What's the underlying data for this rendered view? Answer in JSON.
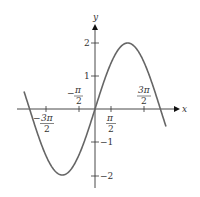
{
  "chart_data": {
    "type": "line",
    "title": "",
    "function": "y = 2 sin(x)",
    "xlabel": "x",
    "ylabel": "y",
    "xlim": [
      -2.2,
      2.2
    ],
    "xlim_note": "in units of pi: approx -2.2 to 2.2",
    "ylim": [
      -2.5,
      2.5
    ],
    "grid": false,
    "legend": null,
    "x_ticks": [
      {
        "value": -4.712,
        "label_num": "3π",
        "label_den": "2",
        "sign": "−"
      },
      {
        "value": -1.571,
        "label_num": "π",
        "label_den": "2",
        "sign": "−"
      },
      {
        "value": 1.571,
        "label_num": "π",
        "label_den": "2",
        "sign": ""
      },
      {
        "value": 4.712,
        "label_num": "3π",
        "label_den": "2",
        "sign": ""
      }
    ],
    "y_ticks": [
      {
        "value": 2,
        "label": "2"
      },
      {
        "value": 1,
        "label": "1"
      },
      {
        "value": -1,
        "label": "−1"
      },
      {
        "value": -2,
        "label": "−2"
      }
    ],
    "series": [
      {
        "name": "2 sin x",
        "color": "#666666",
        "x": [
          -6.8,
          -6.28,
          -4.71,
          -3.14,
          -1.57,
          0,
          1.57,
          3.14,
          4.71,
          6.28,
          6.8
        ],
        "y": [
          -0.99,
          0,
          2,
          0,
          -2,
          0,
          2,
          0,
          -2,
          0,
          0.99
        ]
      }
    ]
  },
  "axes": {
    "x_label": "x",
    "y_label": "y"
  },
  "colors": {
    "curve": "#666666",
    "axis": "#333333"
  }
}
